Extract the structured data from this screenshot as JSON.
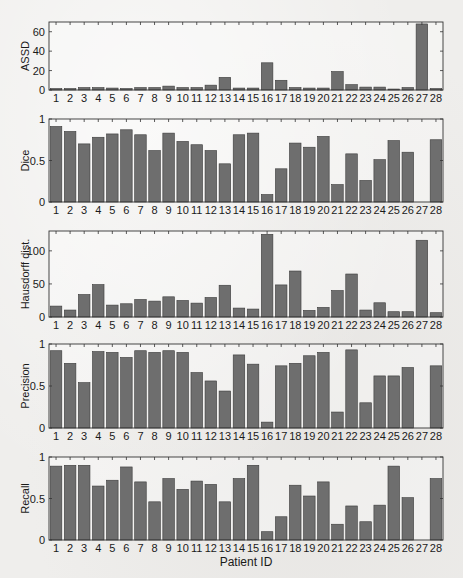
{
  "figure": {
    "xlabel": "Patient ID",
    "bar_color": "#6e6e6e",
    "bar_edge_color": "#3a3a3a",
    "axis_color": "#333333"
  },
  "chart_data": [
    {
      "type": "bar",
      "title": "",
      "xlabel": "",
      "ylabel": "ASSD",
      "categories": [
        "1",
        "2",
        "3",
        "4",
        "5",
        "6",
        "7",
        "8",
        "9",
        "10",
        "11",
        "12",
        "13",
        "14",
        "15",
        "16",
        "17",
        "18",
        "19",
        "20",
        "21",
        "22",
        "23",
        "24",
        "25",
        "26",
        "27",
        "28"
      ],
      "values": [
        1.5,
        1.5,
        2.5,
        2.5,
        2,
        1.5,
        2.5,
        2.5,
        4,
        2.5,
        2.5,
        5,
        13,
        2,
        2,
        28,
        10,
        2.5,
        2,
        2,
        19,
        5.5,
        3,
        3,
        1,
        2.5,
        68,
        1.5
      ],
      "ylim": [
        0,
        70
      ],
      "yticks": [
        0,
        20,
        40,
        60
      ],
      "grid": false,
      "legend": null
    },
    {
      "type": "bar",
      "title": "",
      "xlabel": "",
      "ylabel": "Dice",
      "categories": [
        "1",
        "2",
        "3",
        "4",
        "5",
        "6",
        "7",
        "8",
        "9",
        "10",
        "11",
        "12",
        "13",
        "14",
        "15",
        "16",
        "17",
        "18",
        "19",
        "20",
        "21",
        "22",
        "23",
        "24",
        "25",
        "26",
        "27",
        "28"
      ],
      "values": [
        0.91,
        0.85,
        0.7,
        0.78,
        0.82,
        0.87,
        0.81,
        0.62,
        0.83,
        0.73,
        0.69,
        0.62,
        0.46,
        0.81,
        0.83,
        0.09,
        0.4,
        0.71,
        0.66,
        0.79,
        0.21,
        0.58,
        0.26,
        0.51,
        0.74,
        0.6,
        0.0,
        0.75
      ],
      "ylim": [
        0,
        1
      ],
      "yticks": [
        0,
        0.5,
        1
      ],
      "grid": false,
      "legend": null
    },
    {
      "type": "bar",
      "title": "",
      "xlabel": "",
      "ylabel": "Hausdorff dist.",
      "categories": [
        "1",
        "2",
        "3",
        "4",
        "5",
        "6",
        "7",
        "8",
        "9",
        "10",
        "11",
        "12",
        "13",
        "14",
        "15",
        "16",
        "17",
        "18",
        "19",
        "20",
        "21",
        "22",
        "23",
        "24",
        "25",
        "26",
        "27",
        "28"
      ],
      "values": [
        16.5,
        10.5,
        34,
        49,
        18,
        20,
        26.5,
        24,
        30.5,
        25,
        21,
        29.5,
        48,
        13.5,
        12,
        125,
        48.5,
        69.5,
        10,
        14.5,
        40,
        65,
        10.5,
        21.5,
        8,
        8,
        116,
        6.5
      ],
      "ylim": [
        0,
        130
      ],
      "yticks": [
        0,
        50,
        100
      ],
      "grid": false,
      "legend": null
    },
    {
      "type": "bar",
      "title": "",
      "xlabel": "",
      "ylabel": "Precision",
      "categories": [
        "1",
        "2",
        "3",
        "4",
        "5",
        "6",
        "7",
        "8",
        "9",
        "10",
        "11",
        "12",
        "13",
        "14",
        "15",
        "16",
        "17",
        "18",
        "19",
        "20",
        "21",
        "22",
        "23",
        "24",
        "25",
        "26",
        "27",
        "28"
      ],
      "values": [
        0.92,
        0.77,
        0.54,
        0.91,
        0.9,
        0.84,
        0.92,
        0.9,
        0.92,
        0.9,
        0.66,
        0.56,
        0.44,
        0.87,
        0.76,
        0.07,
        0.74,
        0.77,
        0.86,
        0.9,
        0.19,
        0.93,
        0.3,
        0.62,
        0.62,
        0.72,
        0.0,
        0.74
      ],
      "ylim": [
        0,
        1
      ],
      "yticks": [
        0,
        0.5,
        1
      ],
      "grid": false,
      "legend": null
    },
    {
      "type": "bar",
      "title": "",
      "xlabel": "Patient ID",
      "ylabel": "Recall",
      "categories": [
        "1",
        "2",
        "3",
        "4",
        "5",
        "6",
        "7",
        "8",
        "9",
        "10",
        "11",
        "12",
        "13",
        "14",
        "15",
        "16",
        "17",
        "18",
        "19",
        "20",
        "21",
        "22",
        "23",
        "24",
        "25",
        "26",
        "27",
        "28"
      ],
      "values": [
        0.89,
        0.9,
        0.9,
        0.65,
        0.72,
        0.88,
        0.7,
        0.46,
        0.74,
        0.61,
        0.71,
        0.67,
        0.46,
        0.74,
        0.9,
        0.1,
        0.28,
        0.66,
        0.53,
        0.7,
        0.19,
        0.41,
        0.22,
        0.42,
        0.89,
        0.51,
        0.0,
        0.74
      ],
      "ylim": [
        0,
        1
      ],
      "yticks": [
        0,
        0.5,
        1
      ],
      "grid": false,
      "legend": null
    }
  ]
}
